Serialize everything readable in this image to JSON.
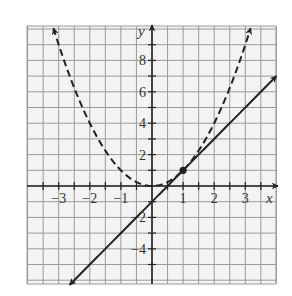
{
  "chart_data": {
    "type": "line",
    "title": "",
    "xlabel": "x",
    "ylabel": "y",
    "xlim": [
      -4,
      4
    ],
    "ylim": [
      -6.3,
      10.2
    ],
    "grid": true,
    "x_ticks": [
      -3,
      -2,
      -1,
      1,
      2,
      3
    ],
    "x_tick_labels": [
      "−3",
      "−2",
      "−1",
      "1",
      "2",
      "3"
    ],
    "y_ticks": [
      -4,
      -2,
      2,
      4,
      6,
      8
    ],
    "y_tick_labels": [
      "−4",
      "−2",
      "2",
      "4",
      "6",
      "8"
    ],
    "series": [
      {
        "name": "parabola",
        "equation": "y = x^2",
        "style": "dashed",
        "color": "#222222",
        "x_range": [
          -3.17,
          3.17
        ],
        "arrows": "both"
      },
      {
        "name": "tangent line",
        "equation": "y = 2x - 1",
        "style": "solid",
        "color": "#222222",
        "x_range": [
          -2.65,
          4.0
        ],
        "arrows": "both"
      }
    ],
    "points": [
      {
        "label": "point of tangency",
        "x": 1,
        "y": 1
      }
    ]
  },
  "axes": {
    "x_label": "x",
    "y_label": "y"
  },
  "colors": {
    "grid": "#9a9a9a",
    "grid_bg": "#f2f2f2",
    "ink": "#222222"
  }
}
